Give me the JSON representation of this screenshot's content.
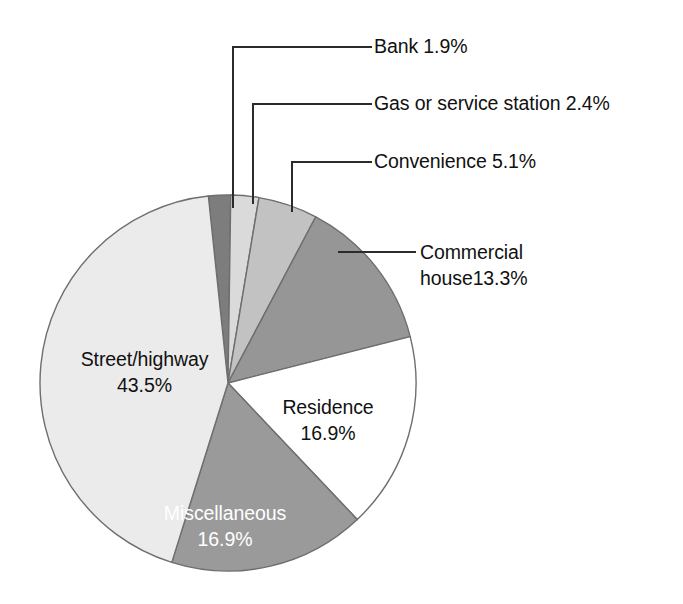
{
  "chart_data": {
    "type": "pie",
    "title": "",
    "subtitle": "",
    "xlabel": "",
    "ylabel": "",
    "legend_position": "none",
    "grid": false,
    "units": "percent",
    "total": 100.0,
    "categories": [
      "Street/highway",
      "Bank",
      "Gas or service station",
      "Convenience",
      "Commercial house",
      "Residence",
      "Miscellaneous"
    ],
    "values": [
      43.5,
      1.9,
      2.4,
      5.1,
      13.3,
      16.9,
      16.9
    ],
    "slices": [
      {
        "key": "street-highway",
        "label": "Street/highway",
        "value": 43.5,
        "value_text": "43.5%",
        "color": "#ebebeb",
        "label_placement": "inside",
        "label_color": "dark",
        "line1": "Street/highway",
        "line2": "43.5%"
      },
      {
        "key": "bank",
        "label": "Bank",
        "value": 1.9,
        "value_text": "1.9%",
        "color": "#7d7d7d",
        "label_placement": "callout",
        "label_color": "dark",
        "callout_text": "Bank 1.9%"
      },
      {
        "key": "gas-or-service-station",
        "label": "Gas or service station",
        "value": 2.4,
        "value_text": "2.4%",
        "color": "#dadada",
        "label_placement": "callout",
        "label_color": "dark",
        "callout_text": "Gas or service station 2.4%"
      },
      {
        "key": "convenience",
        "label": "Convenience",
        "value": 5.1,
        "value_text": "5.1%",
        "color": "#c2c2c2",
        "label_placement": "callout",
        "label_color": "dark",
        "callout_text": "Convenience 5.1%"
      },
      {
        "key": "commercial-house",
        "label": "Commercial house",
        "value": 13.3,
        "value_text": "13.3%",
        "color": "#969696",
        "label_placement": "callout",
        "label_color": "dark",
        "line1": "Commercial",
        "line2": "house13.3%"
      },
      {
        "key": "residence",
        "label": "Residence",
        "value": 16.9,
        "value_text": "16.9%",
        "color": "#ffffff",
        "label_placement": "inside",
        "label_color": "dark",
        "line1": "Residence",
        "line2": "16.9%"
      },
      {
        "key": "miscellaneous",
        "label": "Miscellaneous",
        "value": 16.9,
        "value_text": "16.9%",
        "color": "#9a9a9a",
        "label_placement": "inside",
        "label_color": "light",
        "line1": "Miscellaneous",
        "line2": "16.9%"
      }
    ]
  },
  "labels": {
    "bank": "Bank 1.9%",
    "gas": "Gas or service station 2.4%",
    "convenience": "Convenience 5.1%",
    "commercial_line1": "Commercial",
    "commercial_line2": "house13.3%",
    "street_line1": "Street/highway",
    "street_line2": "43.5%",
    "residence_line1": "Residence",
    "residence_line2": "16.9%",
    "misc_line1": "Miscellaneous",
    "misc_line2": "16.9%"
  },
  "style": {
    "outline_color": "#6e6e6e",
    "leader_color": "#2b2b2b",
    "background": "#ffffff"
  }
}
